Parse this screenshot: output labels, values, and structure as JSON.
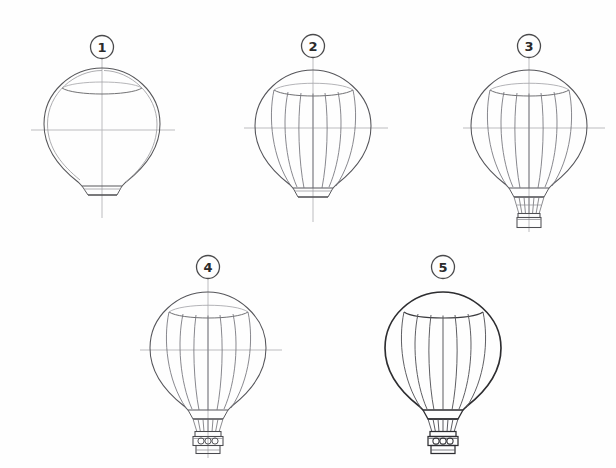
{
  "page": {
    "background_color": "#fefefe",
    "width": 616,
    "height": 468,
    "medium": "pencil line drawing on white paper"
  },
  "palette": {
    "paper": "#fefefe",
    "ink_dark": "#3a3a3c",
    "ink_final": "#2a2a2c",
    "ink_light": "#9a9a9e",
    "construction_line": "#b4b4b8",
    "badge_stroke": "#4a4a4c",
    "badge_text": "#2b2b2b"
  },
  "steps": [
    {
      "id": "step-1",
      "number": "1",
      "badge_cx": 102,
      "badge_cy": 47,
      "origin_x": 102,
      "origin_y": 130,
      "caption": "Block in the teardrop envelope shape over crossed axes",
      "features": {
        "construction_axes": true,
        "envelope_outline": true,
        "crown_ellipse": true,
        "gore_lines": false,
        "skirt": true,
        "ropes": false,
        "basket": false,
        "basket_tanks": false,
        "finished_inking": false
      }
    },
    {
      "id": "step-2",
      "number": "2",
      "badge_cx": 313,
      "badge_cy": 46,
      "origin_x": 313,
      "origin_y": 130,
      "caption": "Add the vertical gore panel lines across the envelope",
      "features": {
        "construction_axes": true,
        "envelope_outline": true,
        "crown_ellipse": true,
        "gore_lines": true,
        "skirt": true,
        "ropes": false,
        "basket": false,
        "basket_tanks": false,
        "finished_inking": false
      }
    },
    {
      "id": "step-3",
      "number": "3",
      "badge_cx": 529,
      "badge_cy": 46,
      "origin_x": 529,
      "origin_y": 130,
      "caption": "Draw the suspension ropes and the square basket",
      "features": {
        "construction_axes": true,
        "envelope_outline": true,
        "crown_ellipse": true,
        "gore_lines": true,
        "skirt": true,
        "ropes": true,
        "basket": true,
        "basket_tanks": false,
        "finished_inking": false
      }
    },
    {
      "id": "step-4",
      "number": "4",
      "badge_cx": 208,
      "badge_cy": 267,
      "origin_x": 208,
      "origin_y": 350,
      "caption": "Detail the basket with burner tanks and rim bands",
      "features": {
        "construction_axes": true,
        "envelope_outline": true,
        "crown_ellipse": true,
        "gore_lines": true,
        "skirt": true,
        "ropes": true,
        "basket": true,
        "basket_tanks": true,
        "finished_inking": false
      }
    },
    {
      "id": "step-5",
      "number": "5",
      "badge_cx": 443,
      "badge_cy": 267,
      "origin_x": 443,
      "origin_y": 350,
      "caption": "Erase the guides and darken the finished outline",
      "features": {
        "construction_axes": false,
        "envelope_outline": true,
        "crown_ellipse": true,
        "gore_lines": true,
        "skirt": true,
        "ropes": true,
        "basket": true,
        "basket_tanks": true,
        "finished_inking": true
      }
    }
  ],
  "geometry": {
    "envelope_half_width": 58,
    "envelope_top_dy": -62,
    "envelope_bottom_dy": 76,
    "crown_half_width": 40,
    "crown_dy": -45,
    "gore_count": 7,
    "basket_tank_count": 3
  }
}
